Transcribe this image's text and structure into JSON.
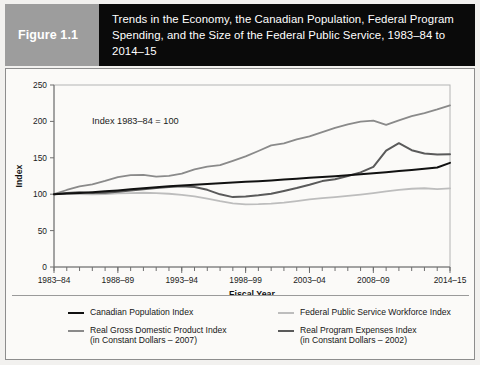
{
  "figure": {
    "number_label": "Figure 1.1",
    "title": "Trends in the Economy, the Canadian Population, Federal Program Spending, and the Size of the Federal Public Service, 1983–84 to 2014–15"
  },
  "colors": {
    "figure_number_background": "#9d9d9d",
    "title_background": "#0a0a0a",
    "title_text": "#ffffff",
    "panel_background": "#fbfaf8",
    "page_background": "#f2f1ef",
    "axis": "#6f6f6f",
    "canadian_population": "#111111",
    "federal_public_service_workforce": "#bdbdbd",
    "real_gdp": "#8a8a8a",
    "real_program_expenses": "#5a5a5a"
  },
  "chart_data": {
    "type": "line",
    "title": "Trends in the Economy, the Canadian Population, Federal Program Spending, and the Size of the Federal Public Service, 1983–84 to 2014–15",
    "annotation": "Index 1983–84 = 100",
    "xlabel": "Fiscal Year",
    "ylabel": "Index",
    "ylim": [
      0,
      250
    ],
    "yticks": [
      0,
      50,
      100,
      150,
      200,
      250
    ],
    "grid": false,
    "legend_position": "bottom",
    "x": [
      "1983–84",
      "1984–85",
      "1985–86",
      "1986–87",
      "1987–88",
      "1988–89",
      "1989–90",
      "1990–91",
      "1991–92",
      "1992–93",
      "1993–94",
      "1994–95",
      "1995–96",
      "1996–97",
      "1997–98",
      "1998–99",
      "1999–00",
      "2000–01",
      "2001–02",
      "2002–03",
      "2003–04",
      "2004–05",
      "2005–06",
      "2006–07",
      "2007–08",
      "2008–09",
      "2009–10",
      "2010–11",
      "2011–12",
      "2012–13",
      "2013–14",
      "2014–15"
    ],
    "xtick_labels": [
      "1983–84",
      "1988–89",
      "1993–94",
      "1998–99",
      "2003–04",
      "2008–09",
      "2014–15"
    ],
    "xtick_indices": [
      0,
      5,
      10,
      15,
      20,
      25,
      31
    ],
    "series": [
      {
        "name": "Canadian Population Index",
        "color": "#111111",
        "width": 2.0,
        "values": [
          100,
          101,
          101.8,
          102.8,
          103.9,
          105.2,
          106.7,
          108.2,
          109.6,
          110.8,
          111.9,
          113.0,
          114.1,
          115.2,
          116.1,
          117.0,
          117.9,
          118.9,
          120.1,
          121.3,
          122.5,
          123.6,
          124.8,
          126.1,
          127.5,
          128.9,
          130.3,
          131.7,
          133.2,
          134.8,
          136.6,
          143.0
        ]
      },
      {
        "name": "Federal Public Service Workforce Index",
        "color": "#bdbdbd",
        "width": 1.8,
        "values": [
          100,
          100.4,
          100.2,
          99.8,
          100.3,
          101.0,
          101.6,
          102.0,
          101.5,
          100.6,
          99.2,
          97.0,
          94.0,
          90.5,
          87.5,
          86.0,
          86.3,
          87.0,
          88.5,
          90.6,
          92.8,
          94.6,
          96.0,
          97.6,
          99.4,
          101.5,
          103.8,
          106.0,
          107.5,
          108.2,
          107.0,
          108.0
        ]
      },
      {
        "name": "Real Gross Domestic Product Index (in Constant Dollars – 2007)",
        "color": "#8a8a8a",
        "width": 1.8,
        "values": [
          100,
          105.8,
          110.8,
          113.5,
          118.2,
          123.5,
          126.3,
          126.6,
          124.2,
          125.2,
          128.2,
          134.0,
          137.8,
          139.9,
          145.8,
          151.9,
          159.4,
          167.0,
          169.8,
          175.3,
          179.5,
          185.3,
          191.2,
          195.9,
          199.8,
          201.1,
          195.3,
          201.5,
          207.2,
          211.5,
          216.5,
          222.0
        ]
      },
      {
        "name": "Real Program Expenses Index (in Constant Dollars – 2002)",
        "color": "#5a5a5a",
        "width": 2.0,
        "values": [
          100,
          101.5,
          102.8,
          101.5,
          102.0,
          103.5,
          105.0,
          106.8,
          108.5,
          110.0,
          111.0,
          110.0,
          106.0,
          99.8,
          96.0,
          97.0,
          98.5,
          100.5,
          104.5,
          108.5,
          113.0,
          118.0,
          120.5,
          125.0,
          130.0,
          137.5,
          160.0,
          170.0,
          160.5,
          156.0,
          154.5,
          155.0
        ]
      }
    ]
  },
  "legend": {
    "items": [
      {
        "label": "Canadian Population Index",
        "sublabel": "",
        "color": "#111111",
        "width": 2.4
      },
      {
        "label": "Federal Public Service Workforce Index",
        "sublabel": "",
        "color": "#bdbdbd",
        "width": 2.0
      },
      {
        "label": "Real Gross Domestic Product Index",
        "sublabel": "(in Constant Dollars – 2007)",
        "color": "#8a8a8a",
        "width": 2.0
      },
      {
        "label": "Real Program Expenses Index",
        "sublabel": "(in Constant Dollars – 2002)",
        "color": "#5a5a5a",
        "width": 2.4
      }
    ]
  }
}
